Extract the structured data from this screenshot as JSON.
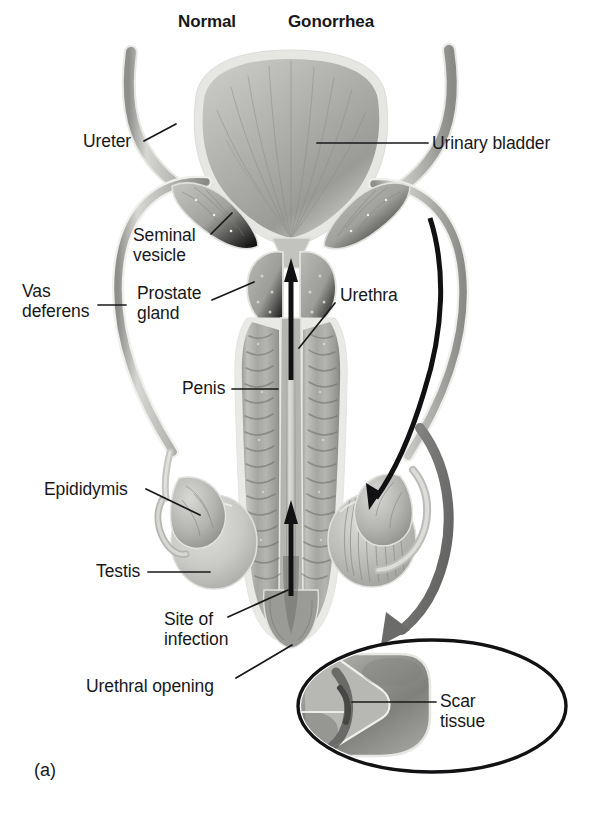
{
  "figure": {
    "panel_letter": "(a)",
    "headings": [
      {
        "name": "heading-normal",
        "text": "Normal",
        "x": 178,
        "y": 12
      },
      {
        "name": "heading-gonorrhea",
        "text": "Gonorrhea",
        "x": 288,
        "y": 12
      }
    ],
    "labels": [
      {
        "name": "label-ureter",
        "text": "Ureter",
        "x": 83,
        "y": 132,
        "align": "left"
      },
      {
        "name": "label-urinary-bladder",
        "text": "Urinary bladder",
        "x": 432,
        "y": 136,
        "align": "left"
      },
      {
        "name": "label-seminal-vesicle",
        "text": "Seminal\nvesicle",
        "x": 133,
        "y": 228,
        "align": "left"
      },
      {
        "name": "label-vas-deferens",
        "text": "Vas\ndeferens",
        "x": 22,
        "y": 284,
        "align": "left"
      },
      {
        "name": "label-prostate-gland",
        "text": "Prostate\ngland",
        "x": 137,
        "y": 286,
        "align": "left"
      },
      {
        "name": "label-urethra",
        "text": "Urethra",
        "x": 338,
        "y": 288,
        "align": "left"
      },
      {
        "name": "label-penis",
        "text": "Penis",
        "x": 182,
        "y": 381,
        "align": "left"
      },
      {
        "name": "label-epididymis",
        "text": "Epididymis",
        "x": 44,
        "y": 482,
        "align": "left"
      },
      {
        "name": "label-testis",
        "text": "Testis",
        "x": 96,
        "y": 564,
        "align": "left"
      },
      {
        "name": "label-site-of-infection",
        "text": "Site of\ninfection",
        "x": 164,
        "y": 612,
        "align": "left"
      },
      {
        "name": "label-urethral-opening",
        "text": "Urethral opening",
        "x": 86,
        "y": 678,
        "align": "left"
      },
      {
        "name": "label-scar-tissue",
        "text": "Scar\ntissue",
        "x": 440,
        "y": 694,
        "align": "left"
      }
    ],
    "colors": {
      "ink": "#18181a",
      "tissue_light": "#d2d2cf",
      "tissue_mid": "#a8a8a4",
      "tissue_dark": "#7c7c78",
      "tissue_shadow": "#5a5a57",
      "outline": "#e9e9e6",
      "arrow_dark": "#111113",
      "arrow_gray": "#6e6e6c",
      "background": "#ffffff"
    }
  }
}
